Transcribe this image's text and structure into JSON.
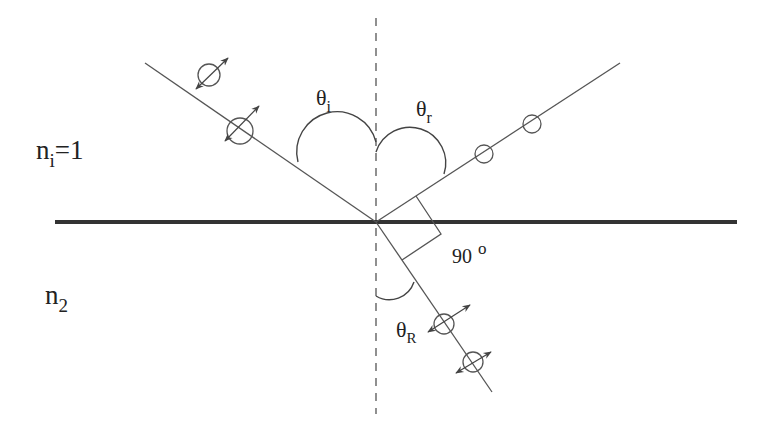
{
  "diagram": {
    "media": {
      "upper": {
        "label_main": "n",
        "label_sub": "i",
        "label_suffix": "=1"
      },
      "lower": {
        "label_main": "n",
        "label_sub": "2"
      }
    },
    "angles": {
      "incident": {
        "symbol": "θ",
        "sub": "i"
      },
      "reflected": {
        "symbol": "θ",
        "sub": "r"
      },
      "refracted": {
        "symbol": "θ",
        "sub": "R"
      },
      "right_angle": {
        "value": "90",
        "unit": "o"
      }
    },
    "rays": [
      {
        "name": "incident-ray",
        "polarization": "both (in-plane arrows and perpendicular circles)"
      },
      {
        "name": "reflected-ray",
        "polarization": "perpendicular only (circles)"
      },
      {
        "name": "refracted-ray",
        "polarization": "both (in-plane arrows and perpendicular circles)"
      }
    ],
    "colors": {
      "line": "#444444",
      "interface": "#333333",
      "text": "#222222",
      "background": "#ffffff"
    }
  }
}
